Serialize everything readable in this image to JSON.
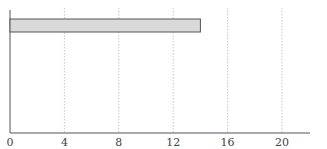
{
  "chart_data": {
    "type": "bar",
    "orientation": "horizontal",
    "categories": [
      ""
    ],
    "values": [
      14
    ],
    "title": "",
    "xlabel": "",
    "ylabel": "",
    "xlim": [
      0,
      22
    ],
    "xticks": [
      0,
      4,
      8,
      12,
      16,
      20
    ],
    "grid": {
      "x": true,
      "style": "dotted"
    },
    "legend": null,
    "bar_color": "#d9d9d9",
    "bar_edge_color": "#555555"
  },
  "axis": {
    "tick_labels": [
      "0",
      "4",
      "8",
      "12",
      "16",
      "20"
    ]
  }
}
